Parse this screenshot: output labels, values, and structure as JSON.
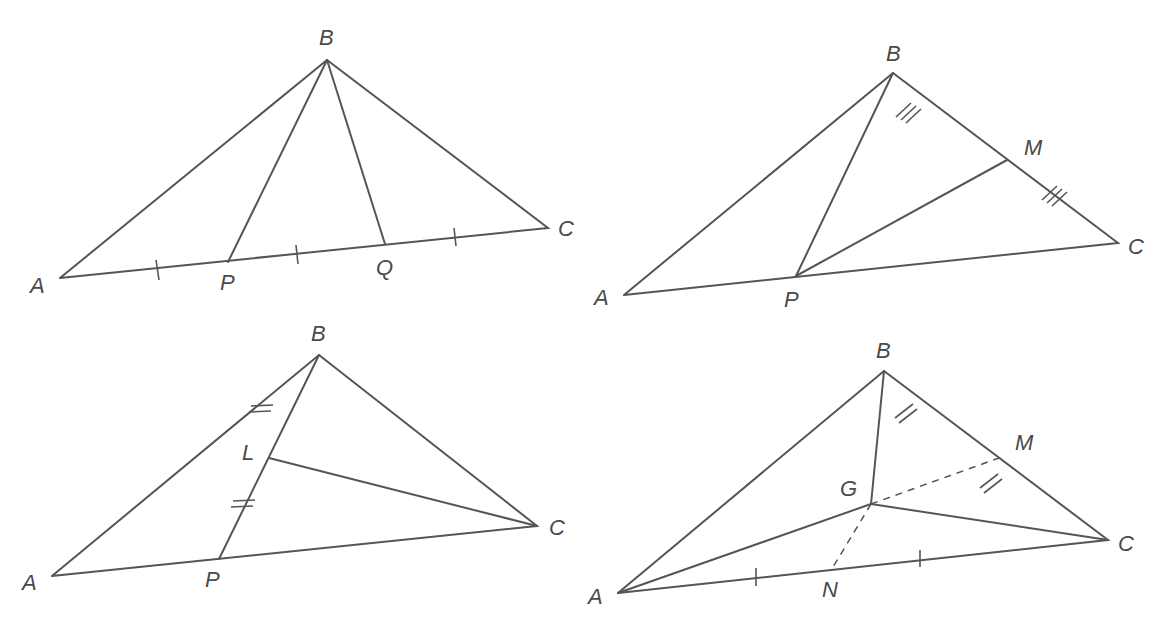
{
  "figures": [
    {
      "id": "fig1",
      "description": "Triangle ABC with AC trisected by P and Q; cevians BP and BQ",
      "labels": {
        "A": "A",
        "B": "B",
        "C": "C",
        "P": "P",
        "Q": "Q"
      },
      "points": {
        "A": [
          60,
          278
        ],
        "B": [
          327,
          60
        ],
        "C": [
          548,
          228
        ],
        "P": [
          228,
          262
        ],
        "Q": [
          385,
          244
        ]
      },
      "equal_marks": "single tick on AP, PQ, QC"
    },
    {
      "id": "fig2",
      "description": "Triangle ABC with P on AC, M midpoint of BC; segments BP and PM",
      "labels": {
        "A": "A",
        "B": "B",
        "C": "C",
        "P": "P",
        "M": "M"
      },
      "points": {
        "A": [
          624,
          295
        ],
        "B": [
          893,
          73
        ],
        "C": [
          1118,
          243
        ],
        "P": [
          796,
          276
        ],
        "M": [
          1007,
          160
        ]
      },
      "equal_marks": "triple tick on BM and MC"
    },
    {
      "id": "fig3",
      "description": "Triangle ABC with P on AC, L midpoint of BP; segment LC",
      "labels": {
        "A": "A",
        "B": "B",
        "C": "C",
        "P": "P",
        "L": "L"
      },
      "points": {
        "A": [
          52,
          576
        ],
        "B": [
          319,
          355
        ],
        "C": [
          537,
          526
        ],
        "P": [
          219,
          559
        ],
        "L": [
          269,
          458
        ]
      },
      "equal_marks": "double tick on BL and LP"
    },
    {
      "id": "fig4",
      "description": "Triangle ABC with centroid G; M midpoint of BC, N midpoint of AC; dashed GM and GN",
      "labels": {
        "A": "A",
        "B": "B",
        "C": "C",
        "G": "G",
        "M": "M",
        "N": "N"
      },
      "points": {
        "A": [
          618,
          593
        ],
        "B": [
          884,
          371
        ],
        "C": [
          1108,
          540
        ],
        "G": [
          871,
          504
        ],
        "M": [
          999,
          458
        ],
        "N": [
          833,
          567
        ]
      },
      "equal_marks": "double tick on BM and MC; single tick on AN and NC"
    }
  ]
}
